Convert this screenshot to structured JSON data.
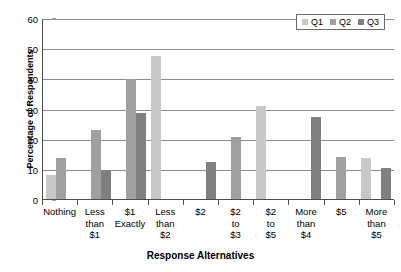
{
  "chart_data": {
    "type": "bar",
    "title": "",
    "xlabel": "Response Alternatives",
    "ylabel": "Percentage of Respondents",
    "ylim": [
      0,
      60
    ],
    "yticks": [
      0,
      10,
      20,
      30,
      40,
      50,
      60
    ],
    "grid": true,
    "legend_position": "top-right",
    "categories": [
      "Nothing",
      "Less than $1",
      "$1 Exactly",
      "Less than $2",
      "$2",
      "$2 to $3",
      "$2 to $5",
      "More than $4",
      "$5",
      "More than $5"
    ],
    "category_lines": [
      [
        "Nothing"
      ],
      [
        "Less",
        "than",
        "$1"
      ],
      [
        "$1",
        "Exactly"
      ],
      [
        "Less",
        "than",
        "$2"
      ],
      [
        "$2"
      ],
      [
        "$2",
        "to",
        "$3"
      ],
      [
        "$2",
        "to",
        "$5"
      ],
      [
        "More",
        "than",
        "$4"
      ],
      [
        "$5"
      ],
      [
        "More",
        "than",
        "$5"
      ]
    ],
    "series": [
      {
        "name": "Q1",
        "color": "#c8c8c8",
        "values": [
          8.2,
          null,
          null,
          47.8,
          null,
          null,
          31.2,
          null,
          null,
          13.8
        ]
      },
      {
        "name": "Q2",
        "color": "#a0a0a0",
        "values": [
          13.9,
          23.3,
          40.0,
          null,
          null,
          21.0,
          null,
          null,
          14.3,
          null
        ]
      },
      {
        "name": "Q3",
        "color": "#808080",
        "values": [
          null,
          10.1,
          28.8,
          null,
          12.7,
          null,
          null,
          27.5,
          null,
          10.5
        ]
      }
    ]
  },
  "legend": {
    "items": [
      {
        "label": "Q1"
      },
      {
        "label": "Q2"
      },
      {
        "label": "Q3"
      }
    ]
  },
  "axes": {
    "y_title": "Percentage of Respondents",
    "x_title": "Response Alternatives"
  }
}
